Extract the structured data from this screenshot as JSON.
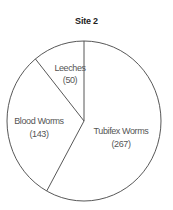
{
  "chart_data": {
    "type": "pie",
    "title": "Site 2",
    "categories": [
      "Tubifex Worms",
      "Blood Worms",
      "Leeches"
    ],
    "values": [
      267,
      143,
      50
    ],
    "labels": [
      {
        "name": "Tubifex Worms",
        "value_label": "(267)"
      },
      {
        "name": "Blood Worms",
        "value_label": "(143)"
      },
      {
        "name": "Leeches",
        "value_label": "(50)"
      }
    ],
    "start_angle": "12 o'clock",
    "direction": "clockwise",
    "fill": "none",
    "legend": "none"
  },
  "colors": {
    "stroke": "#444444",
    "label_text": "#555555",
    "title_text": "#222222",
    "background": "#ffffff"
  }
}
